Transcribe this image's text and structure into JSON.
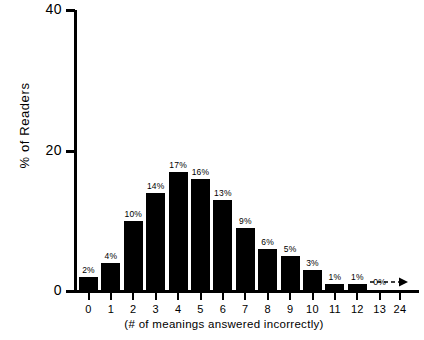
{
  "chart_data": {
    "type": "bar",
    "title": "",
    "xlabel": "(# of meanings answered incorrectly)",
    "ylabel": "% of Readers",
    "categories": [
      "0",
      "1",
      "2",
      "3",
      "4",
      "5",
      "6",
      "7",
      "8",
      "9",
      "10",
      "11",
      "12",
      "13",
      "24"
    ],
    "values": [
      2,
      4,
      10,
      14,
      17,
      16,
      13,
      9,
      6,
      5,
      3,
      1,
      1,
      0,
      0
    ],
    "bar_labels": [
      "2%",
      "4%",
      "10%",
      "14%",
      "17%",
      "16%",
      "13%",
      "9%",
      "6%",
      "5%",
      "3%",
      "1%",
      "1%",
      "0%",
      ""
    ],
    "ylim": [
      0,
      40
    ],
    "ytick_values": [
      0,
      20,
      40
    ],
    "ytick_labels": [
      "0",
      "20",
      "40"
    ],
    "grid": false,
    "legend": false,
    "bar_color": "#000000",
    "axis_color": "#000000",
    "annotations": [
      {
        "name": "dashed-arrow",
        "description": "dashed arrow extending along x-axis from 13 to 24"
      }
    ]
  },
  "axes": {
    "x_title": "(# of meanings answered incorrectly)",
    "y_title": "% of Readers"
  }
}
